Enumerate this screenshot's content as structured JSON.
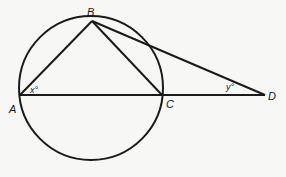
{
  "figure": {
    "type": "geometry",
    "points": {
      "A": {
        "label": "A",
        "x": 20,
        "y": 95
      },
      "B": {
        "label": "B",
        "x": 92,
        "y": 21
      },
      "C": {
        "label": "C",
        "x": 162,
        "y": 95
      },
      "D": {
        "label": "D",
        "x": 265,
        "y": 95
      }
    },
    "circle": {
      "cx": 91,
      "cy": 88,
      "r": 72
    },
    "angles": {
      "x": {
        "label": "x°",
        "vertex": "A"
      },
      "y": {
        "label": "y°",
        "vertex": "D"
      }
    },
    "stroke_color": "#1a1a1a"
  }
}
